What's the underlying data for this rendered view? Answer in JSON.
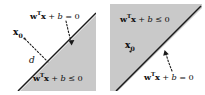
{
  "figure": {
    "width": 205,
    "height": 95,
    "background": "#ffffff",
    "shade_color": "#c9c9c9",
    "line_color": "#1a1a1a",
    "text_color": "#0d0d0d"
  },
  "panels": [
    {
      "id": "left",
      "boundary_label": "wᵀx + b = 0",
      "region_label": "wᵀx + b ≤ 0",
      "point_label": "x₀",
      "distance_label": "d",
      "shaded_side": "below-right",
      "point_side": "unshaded",
      "boundary_label_parts": {
        "w": "w",
        "transpose": "T",
        "x": "x",
        "plus_b": " + b = 0"
      },
      "region_label_parts": {
        "w": "w",
        "transpose": "T",
        "x": "x",
        "plus_b": " + b ≤ 0"
      },
      "point_parts": {
        "base": "x",
        "sub": "0"
      }
    },
    {
      "id": "right",
      "boundary_label": "wᵀx + b = 0",
      "region_label": "wᵀx + b ≤ 0",
      "point_label": "x₀",
      "shaded_side": "above-left",
      "point_side": "shaded",
      "boundary_label_parts": {
        "w": "w",
        "transpose": "T",
        "x": "x",
        "plus_b": " + b = 0"
      },
      "region_label_parts": {
        "w": "w",
        "transpose": "T",
        "x": "x",
        "plus_b": " + b ≤ 0"
      },
      "point_parts": {
        "base": "x",
        "sub": "0"
      }
    }
  ]
}
